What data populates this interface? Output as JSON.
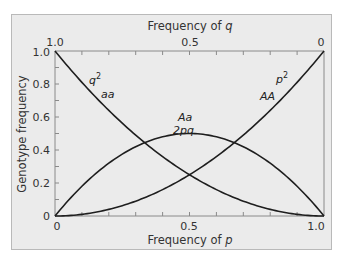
{
  "chart_data": {
    "type": "line",
    "title": "",
    "xlabel": "Frequency of p",
    "x2label": "Frequency of q",
    "ylabel": "Genotype frequency",
    "xlim": [
      0,
      1.0
    ],
    "ylim": [
      0,
      1.0
    ],
    "x_ticks": [
      "0",
      "0.5",
      "1.0"
    ],
    "x2_ticks": [
      "1.0",
      "0.5",
      "0"
    ],
    "y_ticks": [
      "0",
      "0.2",
      "0.4",
      "0.6",
      "0.8",
      "1.0"
    ],
    "grid": false,
    "legend": "none",
    "x": [
      0,
      0.1,
      0.2,
      0.3,
      0.4,
      0.5,
      0.6,
      0.7,
      0.8,
      0.9,
      1.0
    ],
    "series": [
      {
        "name": "aa (q^2)",
        "label_top": "q2",
        "label_bottom": "aa",
        "values": [
          1.0,
          0.81,
          0.64,
          0.49,
          0.36,
          0.25,
          0.16,
          0.09,
          0.04,
          0.01,
          0.0
        ]
      },
      {
        "name": "AA (p^2)",
        "label_top": "p2",
        "label_bottom": "AA",
        "values": [
          0.0,
          0.01,
          0.04,
          0.09,
          0.16,
          0.25,
          0.36,
          0.49,
          0.64,
          0.81,
          1.0
        ]
      },
      {
        "name": "Aa (2pq)",
        "label_top": "Aa",
        "label_bottom": "2pq",
        "values": [
          0.0,
          0.18,
          0.32,
          0.42,
          0.48,
          0.5,
          0.48,
          0.42,
          0.32,
          0.18,
          0.0
        ]
      }
    ],
    "annotations": [
      {
        "text": "q²",
        "sub": "aa",
        "series": "aa"
      },
      {
        "text": "p²",
        "sub": "AA",
        "series": "AA"
      },
      {
        "text": "Aa",
        "sub": "2pq",
        "series": "Aa"
      }
    ]
  },
  "labels": {
    "top_axis_title_prefix": "Frequency of ",
    "top_axis_var": "q",
    "bottom_axis_title_prefix": "Frequency of ",
    "bottom_axis_var": "p",
    "y_axis_title": "Genotype frequency",
    "q2": "q",
    "q2_exp": "2",
    "aa": "aa",
    "p2": "p",
    "p2_exp": "2",
    "AA": "AA",
    "Aa": "Aa",
    "twopq": "2pq"
  },
  "colors": {
    "background": "#ebebeb",
    "line": "#1e1e1e",
    "frame_border": "#b9b9b9"
  }
}
